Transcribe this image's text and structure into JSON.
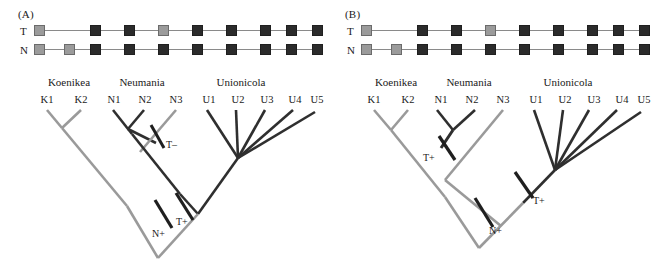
{
  "figure": {
    "colors": {
      "dark": "#2f2f2f",
      "gray": "#9a9a9a",
      "matrix_line": "#8a8a8a",
      "square_dark": "#2b2b2b",
      "square_gray": "#9b9b9b",
      "square_border": "#6b6b6b",
      "text": "#1a1a1a",
      "background": "#ffffff"
    }
  },
  "panels": [
    {
      "id": "A",
      "label": "(A)",
      "matrix": {
        "row_labels": [
          "T",
          "N"
        ],
        "columns": 9,
        "rows": [
          {
            "name": "T",
            "states": [
              "gray",
              "dark",
              "dark",
              "gray",
              "dark",
              "dark",
              "dark",
              "dark",
              "dark"
            ]
          },
          {
            "name": "N",
            "states": [
              "gray",
              "gray",
              "dark",
              "dark",
              "dark",
              "dark",
              "dark",
              "dark",
              "dark"
            ]
          }
        ]
      },
      "tree": {
        "genera": [
          {
            "name": "Koenikea",
            "tips": [
              "K1",
              "K2"
            ]
          },
          {
            "name": "Neumania",
            "tips": [
              "N1",
              "N2",
              "N3"
            ]
          },
          {
            "name": "Unionicola",
            "tips": [
              "U1",
              "U2",
              "U3",
              "U4",
              "U5"
            ]
          }
        ],
        "marks": [
          {
            "label": "T–"
          },
          {
            "label": "T+"
          },
          {
            "label": "N+"
          }
        ]
      }
    },
    {
      "id": "B",
      "label": "(B)",
      "matrix": {
        "row_labels": [
          "T",
          "N"
        ],
        "columns": 9,
        "rows": [
          {
            "name": "T",
            "states": [
              "gray",
              "dark",
              "dark",
              "gray",
              "dark",
              "dark",
              "dark",
              "dark",
              "dark"
            ]
          },
          {
            "name": "N",
            "states": [
              "gray",
              "gray",
              "dark",
              "dark",
              "dark",
              "dark",
              "dark",
              "dark",
              "dark"
            ]
          }
        ]
      },
      "tree": {
        "genera": [
          {
            "name": "Koenikea",
            "tips": [
              "K1",
              "K2"
            ]
          },
          {
            "name": "Neumania",
            "tips": [
              "N1",
              "N2",
              "N3"
            ]
          },
          {
            "name": "Unionicola",
            "tips": [
              "U1",
              "U2",
              "U3",
              "U4",
              "U5"
            ]
          }
        ],
        "marks": [
          {
            "label": "T+"
          },
          {
            "label": "T+"
          },
          {
            "label": "N+"
          }
        ]
      }
    }
  ]
}
